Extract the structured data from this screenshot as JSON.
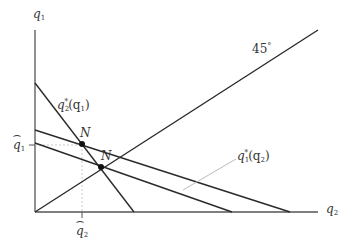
{
  "diagram": {
    "axes": {
      "y_label": "q",
      "y_label_sub": "1",
      "x_label": "q",
      "x_label_sub": "2",
      "origin": [
        35,
        212
      ],
      "y_axis_top": 30,
      "x_axis_right": 318
    },
    "lines": [
      {
        "name": "45-degree-line",
        "from": [
          35,
          212
        ],
        "to": [
          318,
          30
        ],
        "label": "45",
        "label_suffix": "°"
      },
      {
        "name": "reaction-q2-of-q1",
        "from": [
          35,
          83
        ],
        "to": [
          134,
          212
        ],
        "label": "q",
        "label_sub": "2",
        "label_sup": "*",
        "label_arg": "(q",
        "label_arg_sub": "1",
        "label_arg_close": ")"
      },
      {
        "name": "reaction-q1-of-q2-upper",
        "from": [
          35,
          130
        ],
        "to": [
          290,
          212
        ]
      },
      {
        "name": "reaction-q1-of-q2-lower",
        "from": [
          35,
          143
        ],
        "to": [
          232,
          212
        ],
        "label": "q",
        "label_sub": "1",
        "label_sup": "*",
        "label_arg": "(q",
        "label_arg_sub": "2",
        "label_arg_close": ")"
      }
    ],
    "points": [
      {
        "name": "N-upper",
        "label": "N",
        "at": [
          82,
          144
        ]
      },
      {
        "name": "N-lower",
        "label": "N",
        "at": [
          101,
          167
        ]
      }
    ],
    "hat_labels": {
      "q1_hat": {
        "text": "q",
        "sub": "1",
        "tick_y": 145
      },
      "q2_hat": {
        "text": "q",
        "sub": "2",
        "tick_x": 82
      }
    },
    "colors": {
      "line": "#2a2a2a",
      "axis": "#555555",
      "dashed_guide": "#bbbbbb",
      "leader": "#bbbbbb",
      "text": "#333333"
    }
  }
}
